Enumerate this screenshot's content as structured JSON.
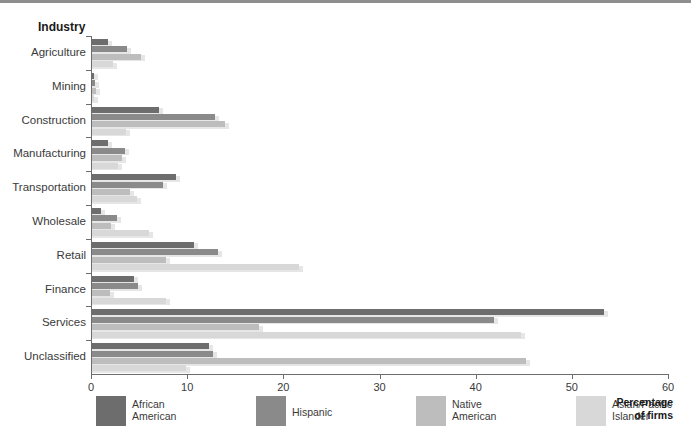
{
  "header": {
    "industry_label": "Industry"
  },
  "axis": {
    "x_title": "Percentage\nof firms",
    "x_ticks": [
      "0",
      "10",
      "20",
      "30",
      "40",
      "50",
      "60"
    ]
  },
  "legend": {
    "items": [
      {
        "label": "African\nAmerican",
        "color": "#6d6d6d",
        "name": "legend-african-american"
      },
      {
        "label": "Hispanic",
        "color": "#8a8a8a",
        "name": "legend-hispanic"
      },
      {
        "label": "Native\nAmerican",
        "color": "#bdbdbd",
        "name": "legend-native-american"
      },
      {
        "label": "Asian/Pacific\nIslander",
        "color": "#d8d8d8",
        "name": "legend-asian-pacific-islander"
      }
    ]
  },
  "chart_data": {
    "type": "bar",
    "orientation": "horizontal",
    "title": "",
    "xlabel": "Percentage of firms",
    "ylabel": "Industry",
    "xlim": [
      0,
      60
    ],
    "xticks": [
      0,
      10,
      20,
      30,
      40,
      50,
      60
    ],
    "grid": false,
    "legend_position": "bottom",
    "categories": [
      "Agriculture",
      "Mining",
      "Construction",
      "Manufacturing",
      "Transportation",
      "Wholesale",
      "Retail",
      "Finance",
      "Services",
      "Unclassified"
    ],
    "series": [
      {
        "name": "African American",
        "color": "#6d6d6d",
        "values": [
          1.7,
          0.2,
          7.0,
          1.7,
          8.7,
          0.9,
          10.6,
          4.4,
          53.2,
          12.2
        ]
      },
      {
        "name": "Hispanic",
        "color": "#8a8a8a",
        "values": [
          3.6,
          0.3,
          12.8,
          3.4,
          7.4,
          2.6,
          13.1,
          4.8,
          41.8,
          12.6
        ]
      },
      {
        "name": "Native American",
        "color": "#bdbdbd",
        "values": [
          5.1,
          0.4,
          13.8,
          3.1,
          3.9,
          2.0,
          7.7,
          1.9,
          17.4,
          45.1
        ]
      },
      {
        "name": "Asian/Pacific Islander",
        "color": "#d8d8d8",
        "values": [
          2.2,
          0.2,
          3.5,
          2.7,
          4.7,
          5.9,
          21.5,
          7.7,
          44.6,
          9.8
        ]
      }
    ]
  }
}
